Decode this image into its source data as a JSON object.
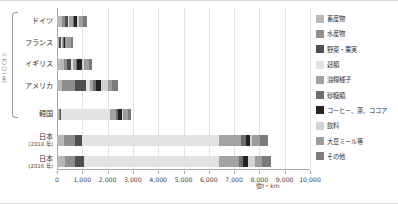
{
  "axis": {
    "unit_label": "億t・km",
    "group_label": "（二〇〇一年）",
    "ticks": [
      "0",
      "1,000",
      "2,000",
      "3,000",
      "4,000",
      "5,000",
      "6,000",
      "7,000",
      "8,000",
      "9,000",
      "10,000"
    ]
  },
  "legend": {
    "items": [
      {
        "label": "畜産物",
        "color": "#b9b9b9"
      },
      {
        "label": "水産物",
        "color": "#8f8f8f"
      },
      {
        "label": "野菜・果実",
        "color": "#4f4f4f"
      },
      {
        "label": "穀類",
        "color": "#e3e3e3"
      },
      {
        "label": "油糧種子",
        "color": "#a3a3a3"
      },
      {
        "label": "砂糖類",
        "color": "#6e6e6e"
      },
      {
        "label": "コーヒー、茶、ココア",
        "color": "#232323"
      },
      {
        "label": "飲料",
        "color": "#d2d2d2"
      },
      {
        "label": "大豆ミール等",
        "color": "#9d9d9d"
      },
      {
        "label": "その他",
        "color": "#7c7c7c"
      }
    ]
  },
  "chart_data": {
    "type": "bar",
    "orientation": "horizontal",
    "stacked": true,
    "title": "",
    "xlabel": "億t・km",
    "ylabel": "",
    "xlim": [
      0,
      10000
    ],
    "grid": true,
    "legend_position": "right",
    "categories": [
      "畜産物",
      "水産物",
      "野菜・果実",
      "穀類",
      "油糧種子",
      "砂糖類",
      "コーヒー、茶、ココア",
      "飲料",
      "大豆ミール等",
      "その他"
    ],
    "rows": [
      {
        "name": "ドイツ",
        "sub": "",
        "values": [
          180,
          130,
          120,
          60,
          150,
          40,
          110,
          70,
          160,
          160
        ],
        "total": 1180
      },
      {
        "name": "フランス",
        "sub": "",
        "values": [
          60,
          30,
          70,
          40,
          40,
          20,
          40,
          30,
          220,
          80
        ],
        "total": 630
      },
      {
        "name": "イギリス",
        "sub": "",
        "values": [
          280,
          120,
          160,
          60,
          130,
          60,
          170,
          90,
          180,
          130
        ],
        "total": 1380
      },
      {
        "name": "アメリカ",
        "sub": "",
        "values": [
          190,
          530,
          440,
          150,
          130,
          120,
          190,
          260,
          180,
          210
        ],
        "total": 2400
      },
      {
        "name": "韓国",
        "sub": "",
        "values": [
          60,
          70,
          40,
          1940,
          230,
          80,
          140,
          60,
          190,
          130
        ],
        "total": 2940
      },
      {
        "name": "日本",
        "sub": "(2010 年)",
        "values": [
          260,
          470,
          270,
          5410,
          870,
          180,
          190,
          70,
          290,
          340
        ],
        "total": 8350
      },
      {
        "name": "日本",
        "sub": "(2016 年)",
        "values": [
          310,
          420,
          330,
          5340,
          810,
          160,
          180,
          280,
          280,
          350
        ],
        "total": 8460
      }
    ]
  }
}
